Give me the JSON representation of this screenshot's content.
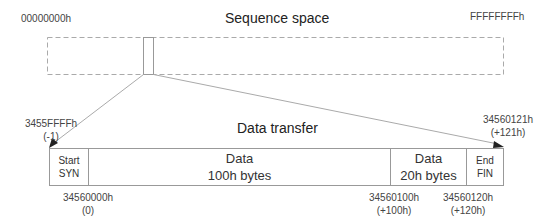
{
  "sequence_space": {
    "title": "Sequence space",
    "start_label": "00000000h",
    "end_label": "FFFFFFFFh"
  },
  "data_transfer": {
    "title": "Data transfer",
    "segments": [
      {
        "line1": "Start",
        "line2": "SYN"
      },
      {
        "line1": "Data",
        "line2": "100h bytes"
      },
      {
        "line1": "Data",
        "line2": "20h bytes"
      },
      {
        "line1": "End",
        "line2": "FIN"
      }
    ],
    "top_markers": [
      {
        "value": "3455FFFFh",
        "offset": "(-1)"
      },
      {
        "value": "34560121h",
        "offset": "(+121h)"
      }
    ],
    "bottom_markers": [
      {
        "value": "34560000h",
        "offset": "(0)"
      },
      {
        "value": "34560100h",
        "offset": "(+100h)"
      },
      {
        "value": "34560120h",
        "offset": "(+120h)"
      }
    ]
  },
  "colors": {
    "line": "#999999",
    "dashed": "#aaaaaa",
    "arrow": "#222222"
  }
}
